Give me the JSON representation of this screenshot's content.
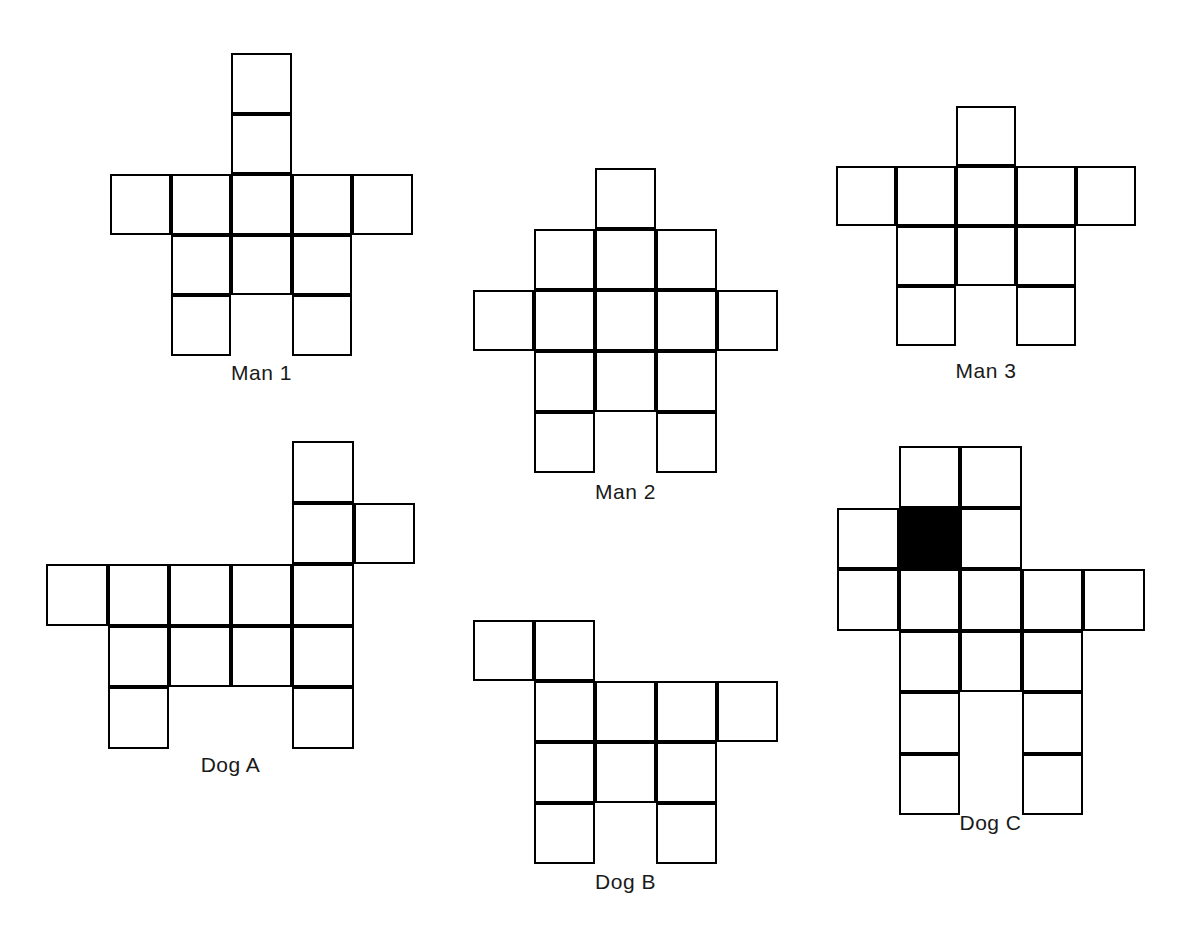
{
  "page": {
    "background_color": "#ffffff",
    "stroke_color": "#000000",
    "fill_color": "#000000",
    "width": 1181,
    "height": 933
  },
  "figures": [
    {
      "id": "man-1",
      "label": "Man 1",
      "origin": {
        "x": 110,
        "y": 53
      },
      "cell": 60.5,
      "cols": 5,
      "rows": 5,
      "label_pos": {
        "x": 110,
        "y": 361,
        "width": 303
      },
      "cells": [
        {
          "c": 2,
          "r": 0,
          "filled": false
        },
        {
          "c": 2,
          "r": 1,
          "filled": false
        },
        {
          "c": 0,
          "r": 2,
          "filled": false
        },
        {
          "c": 1,
          "r": 2,
          "filled": false
        },
        {
          "c": 2,
          "r": 2,
          "filled": false
        },
        {
          "c": 3,
          "r": 2,
          "filled": false
        },
        {
          "c": 4,
          "r": 2,
          "filled": false
        },
        {
          "c": 1,
          "r": 3,
          "filled": false
        },
        {
          "c": 2,
          "r": 3,
          "filled": false
        },
        {
          "c": 3,
          "r": 3,
          "filled": false
        },
        {
          "c": 1,
          "r": 4,
          "filled": false
        },
        {
          "c": 3,
          "r": 4,
          "filled": false
        }
      ]
    },
    {
      "id": "man-2",
      "label": "Man 2",
      "origin": {
        "x": 473,
        "y": 168
      },
      "cell": 61,
      "cols": 5,
      "rows": 5,
      "label_pos": {
        "x": 473,
        "y": 480,
        "width": 305
      },
      "cells": [
        {
          "c": 2,
          "r": 0,
          "filled": false
        },
        {
          "c": 1,
          "r": 1,
          "filled": false
        },
        {
          "c": 2,
          "r": 1,
          "filled": false
        },
        {
          "c": 3,
          "r": 1,
          "filled": false
        },
        {
          "c": 0,
          "r": 2,
          "filled": false
        },
        {
          "c": 1,
          "r": 2,
          "filled": false
        },
        {
          "c": 2,
          "r": 2,
          "filled": false
        },
        {
          "c": 3,
          "r": 2,
          "filled": false
        },
        {
          "c": 4,
          "r": 2,
          "filled": false
        },
        {
          "c": 1,
          "r": 3,
          "filled": false
        },
        {
          "c": 2,
          "r": 3,
          "filled": false
        },
        {
          "c": 3,
          "r": 3,
          "filled": false
        },
        {
          "c": 1,
          "r": 4,
          "filled": false
        },
        {
          "c": 3,
          "r": 4,
          "filled": false
        }
      ]
    },
    {
      "id": "man-3",
      "label": "Man 3",
      "origin": {
        "x": 836,
        "y": 106
      },
      "cell": 60,
      "cols": 5,
      "rows": 4,
      "label_pos": {
        "x": 836,
        "y": 359,
        "width": 300
      },
      "cells": [
        {
          "c": 2,
          "r": 0,
          "filled": false
        },
        {
          "c": 0,
          "r": 1,
          "filled": false
        },
        {
          "c": 1,
          "r": 1,
          "filled": false
        },
        {
          "c": 2,
          "r": 1,
          "filled": false
        },
        {
          "c": 3,
          "r": 1,
          "filled": false
        },
        {
          "c": 4,
          "r": 1,
          "filled": false
        },
        {
          "c": 1,
          "r": 2,
          "filled": false
        },
        {
          "c": 2,
          "r": 2,
          "filled": false
        },
        {
          "c": 3,
          "r": 2,
          "filled": false
        },
        {
          "c": 1,
          "r": 3,
          "filled": false
        },
        {
          "c": 3,
          "r": 3,
          "filled": false
        }
      ]
    },
    {
      "id": "dog-a",
      "label": "Dog A",
      "origin": {
        "x": 46,
        "y": 441
      },
      "cell": 61.5,
      "cols": 6,
      "rows": 5,
      "label_pos": {
        "x": 46,
        "y": 753,
        "width": 369
      },
      "cells": [
        {
          "c": 4,
          "r": 0,
          "filled": false
        },
        {
          "c": 4,
          "r": 1,
          "filled": false
        },
        {
          "c": 5,
          "r": 1,
          "filled": false
        },
        {
          "c": 0,
          "r": 2,
          "filled": false
        },
        {
          "c": 1,
          "r": 2,
          "filled": false
        },
        {
          "c": 2,
          "r": 2,
          "filled": false
        },
        {
          "c": 3,
          "r": 2,
          "filled": false
        },
        {
          "c": 4,
          "r": 2,
          "filled": false
        },
        {
          "c": 1,
          "r": 3,
          "filled": false
        },
        {
          "c": 2,
          "r": 3,
          "filled": false
        },
        {
          "c": 3,
          "r": 3,
          "filled": false
        },
        {
          "c": 4,
          "r": 3,
          "filled": false
        },
        {
          "c": 1,
          "r": 4,
          "filled": false
        },
        {
          "c": 4,
          "r": 4,
          "filled": false
        }
      ]
    },
    {
      "id": "dog-b",
      "label": "Dog B",
      "origin": {
        "x": 473,
        "y": 620
      },
      "cell": 61,
      "cols": 5,
      "rows": 4,
      "label_pos": {
        "x": 473,
        "y": 870,
        "width": 305
      },
      "cells": [
        {
          "c": 0,
          "r": 0,
          "filled": false
        },
        {
          "c": 1,
          "r": 0,
          "filled": false
        },
        {
          "c": 1,
          "r": 1,
          "filled": false
        },
        {
          "c": 2,
          "r": 1,
          "filled": false
        },
        {
          "c": 3,
          "r": 1,
          "filled": false
        },
        {
          "c": 4,
          "r": 1,
          "filled": false
        },
        {
          "c": 1,
          "r": 2,
          "filled": false
        },
        {
          "c": 2,
          "r": 2,
          "filled": false
        },
        {
          "c": 3,
          "r": 2,
          "filled": false
        },
        {
          "c": 1,
          "r": 3,
          "filled": false
        },
        {
          "c": 3,
          "r": 3,
          "filled": false
        }
      ]
    },
    {
      "id": "dog-c",
      "label": "Dog C",
      "origin": {
        "x": 837,
        "y": 446
      },
      "cell": 61.5,
      "cols": 5,
      "rows": 6,
      "label_pos": {
        "x": 837,
        "y": 811,
        "width": 307
      },
      "cells": [
        {
          "c": 1,
          "r": 0,
          "filled": false
        },
        {
          "c": 2,
          "r": 0,
          "filled": false
        },
        {
          "c": 0,
          "r": 1,
          "filled": false
        },
        {
          "c": 1,
          "r": 1,
          "filled": true
        },
        {
          "c": 2,
          "r": 1,
          "filled": false
        },
        {
          "c": 0,
          "r": 2,
          "filled": false
        },
        {
          "c": 1,
          "r": 2,
          "filled": false
        },
        {
          "c": 2,
          "r": 2,
          "filled": false
        },
        {
          "c": 3,
          "r": 2,
          "filled": false
        },
        {
          "c": 4,
          "r": 2,
          "filled": false
        },
        {
          "c": 1,
          "r": 3,
          "filled": false
        },
        {
          "c": 2,
          "r": 3,
          "filled": false
        },
        {
          "c": 3,
          "r": 3,
          "filled": false
        },
        {
          "c": 1,
          "r": 4,
          "filled": false
        },
        {
          "c": 3,
          "r": 4,
          "filled": false
        },
        {
          "c": 1,
          "r": 5,
          "filled": false
        },
        {
          "c": 3,
          "r": 5,
          "filled": false
        }
      ]
    }
  ]
}
